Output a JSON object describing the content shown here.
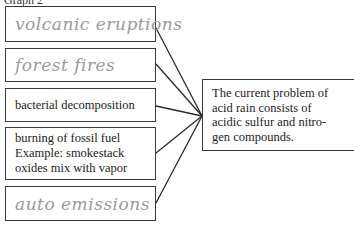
{
  "header": {
    "label": "Graph 2"
  },
  "causes": [
    {
      "text": "volcanic eruptions",
      "style": "handwritten"
    },
    {
      "text": "forest fires",
      "style": "handwritten"
    },
    {
      "text": "bacterial decomposition",
      "style": "printed"
    },
    {
      "lines": [
        "burning of fossil fuel",
        "Example: smokestack",
        "oxides mix with vapor"
      ],
      "style": "printed"
    },
    {
      "text": "auto emissions",
      "style": "handwritten"
    }
  ],
  "effect": {
    "lines": [
      "The current problem of",
      "acid rain consists of",
      "acidic sulfur and nitro-",
      "gen compounds."
    ]
  },
  "colors": {
    "border": "#3a3a3a",
    "handwriting": "#9a9a9a",
    "text": "#222222"
  }
}
